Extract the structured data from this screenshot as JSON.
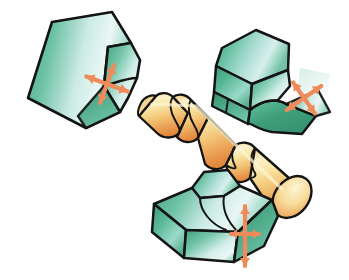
{
  "figure": {
    "background_color": "#ffffff",
    "width": 349,
    "height": 280,
    "style": "technical airbrush illustration, isometric",
    "outline_color": "#1a1a1a"
  },
  "palette": {
    "insert_green_dark": "#3f9e78",
    "insert_green_mid": "#5cbb9a",
    "insert_green_light": "#a8ddd0",
    "insert_highlight": "#e8f6f4",
    "insert_pale_cyan": "#cfeaea",
    "workpiece_yellow": "#f5dd92",
    "workpiece_light": "#fbeec0",
    "workpiece_orange": "#eda45c",
    "workpiece_deep_orange": "#e08a3c",
    "arrow_orange": "#ef8b5a",
    "arrow_orange_dark": "#e0754a",
    "glow_patch": "#bfe3dc",
    "outline": "#141414"
  },
  "workpiece": {
    "name": "stepped-cylindrical-shaft",
    "label": "Workpiece",
    "material_tone": "brass-gold",
    "orientation": "diagonal, upper-left to lower-right",
    "step_count": 3,
    "end_cap": "rounded ellipse at lower-right",
    "sections": [
      {
        "name": "section-small-left",
        "relative_diameter": 0.72
      },
      {
        "name": "section-mid",
        "relative_diameter": 0.86
      },
      {
        "name": "section-large-right",
        "relative_diameter": 1.0
      }
    ]
  },
  "inserts": [
    {
      "id": "insert-upper-left",
      "name": "form-tool-upper-left",
      "label": "Form tool A",
      "position": "upper left",
      "body_color": "#5cbb9a",
      "profile": "flat plate with concave relieved cutting edge",
      "arrow": {
        "name": "feed-direction-cross-arrow",
        "type": "four-way-cross",
        "color": "#ef8b5a",
        "rotation_deg": 20,
        "glow": true
      }
    },
    {
      "id": "insert-upper-right",
      "name": "form-tool-upper-right",
      "label": "Form tool B",
      "position": "upper right",
      "body_color": "#5cbb9a",
      "profile": "prismatic block with stepped relief and radiused nose",
      "arrow": {
        "name": "feed-direction-cross-arrow",
        "type": "four-way-cross",
        "color": "#ef8b5a",
        "rotation_deg": -35,
        "glow": true
      }
    },
    {
      "id": "insert-bottom-center",
      "name": "form-tool-bottom-center",
      "label": "Form tool C",
      "position": "bottom center",
      "body_color": "#5cbb9a",
      "profile": "wedge block with grooved top face and chamfered flank",
      "arrow": {
        "name": "feed-direction-cross-arrow",
        "type": "vertical-cross",
        "color": "#ef8b5a",
        "rotation_deg": 0,
        "glow": true
      }
    }
  ]
}
